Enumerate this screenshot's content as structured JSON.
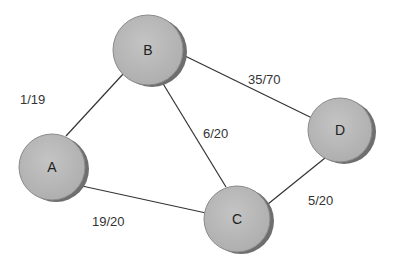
{
  "diagram": {
    "type": "network-flow-graph",
    "nodes": [
      {
        "id": "A",
        "label": "A",
        "cx": 52,
        "cy": 167,
        "r": 33
      },
      {
        "id": "B",
        "label": "B",
        "cx": 148,
        "cy": 50,
        "r": 35
      },
      {
        "id": "C",
        "label": "C",
        "cx": 237,
        "cy": 219,
        "r": 33
      },
      {
        "id": "D",
        "label": "D",
        "cx": 340,
        "cy": 130,
        "r": 32
      }
    ],
    "edges": [
      {
        "from": "A",
        "to": "B",
        "label": "1/19"
      },
      {
        "from": "A",
        "to": "C",
        "label": "19/20"
      },
      {
        "from": "B",
        "to": "C",
        "label": "6/20"
      },
      {
        "from": "B",
        "to": "D",
        "label": "35/70"
      },
      {
        "from": "C",
        "to": "D",
        "label": "5/20"
      }
    ],
    "colors": {
      "node_fill": "#b9b9b9",
      "node_shadow": "#6e6e6e",
      "node_stroke": "#888888",
      "edge": "#333333",
      "text": "#333333"
    }
  }
}
